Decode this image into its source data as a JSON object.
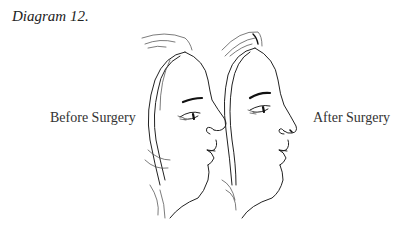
{
  "diagram": {
    "title": "Diagram 12.",
    "labels": {
      "before": "Before Surgery",
      "after": "After Surgery"
    },
    "figures": [
      {
        "id": "before",
        "description": "Female face profile facing right, with larger, more projecting nose and softer chin"
      },
      {
        "id": "after",
        "description": "Female face profile facing right, with refined, smaller upturned nose"
      }
    ],
    "colors": {
      "background": "#ffffff",
      "ink": "#222222"
    }
  }
}
